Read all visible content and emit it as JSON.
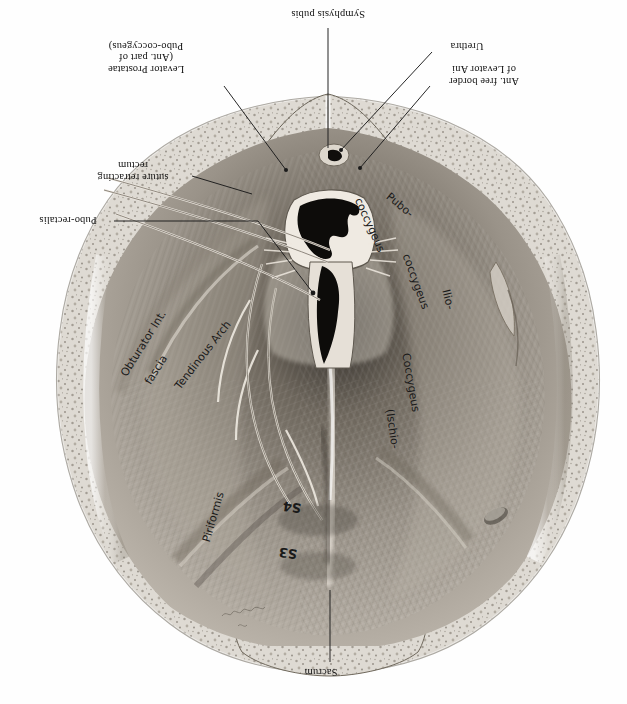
{
  "plate": {
    "title": "Male pelvic floor viewed from above (inverted plate)",
    "orientation": "upside-down",
    "background_color": "#fefefe",
    "ink_color": "#111111"
  },
  "printed_labels": [
    {
      "id": "symphysis-pubis",
      "text": "Symphysis pubis",
      "x": 258,
      "y": 8,
      "w": 140,
      "leader": [
        [
          328,
          28
        ],
        [
          328,
          128
        ]
      ]
    },
    {
      "id": "levator-prostatae",
      "text": "Levator Prostatae\n(Ant. part of\nPubo-coccygeus)",
      "x": 72,
      "y": 40,
      "w": 148,
      "leader": [
        [
          224,
          84
        ],
        [
          284,
          168
        ]
      ]
    },
    {
      "id": "urethra",
      "text": "Urethra",
      "x": 432,
      "y": 40,
      "w": 70,
      "leader": [
        [
          432,
          50
        ],
        [
          338,
          152
        ]
      ]
    },
    {
      "id": "ant-free-border-levator-ani",
      "text": "Ant. free border\nof Levator Ani",
      "x": 432,
      "y": 64,
      "w": 104,
      "leader": [
        [
          430,
          84
        ],
        [
          360,
          166
        ]
      ]
    },
    {
      "id": "suture-retracting-rectum",
      "text": "suture retracting\nrectum",
      "x": 78,
      "y": 160,
      "w": 110,
      "leader": [
        [
          190,
          176
        ],
        [
          255,
          196
        ]
      ]
    },
    {
      "id": "pubo-rectalis",
      "text": "Pubo-rectalis",
      "x": 24,
      "y": 216,
      "w": 88,
      "leader": [
        [
          114,
          221
        ],
        [
          258,
          221
        ],
        [
          312,
          292
        ]
      ]
    },
    {
      "id": "sacrum",
      "text": "Sacrum",
      "x": 288,
      "y": 666,
      "w": 66,
      "leader": [
        [
          330,
          664
        ],
        [
          330,
          590
        ]
      ]
    }
  ],
  "handwritten_labels": [
    {
      "id": "obturator-int-fascia",
      "text": "Obturator Int.",
      "x": 118,
      "y": 372,
      "rotate": -58
    },
    {
      "id": "obturator-fascia-word",
      "text": "fascia",
      "x": 136,
      "y": 374,
      "rotate": -58
    },
    {
      "id": "tendinous-arch",
      "text": "Tendinous Arch",
      "x": 168,
      "y": 378,
      "rotate": -52
    },
    {
      "id": "piriformis",
      "text": "Piriformis",
      "x": 196,
      "y": 530,
      "rotate": -76
    },
    {
      "id": "pubo-coccygeus-hand",
      "text": "Pubo-",
      "x": 392,
      "y": 196,
      "rotate": 38
    },
    {
      "id": "coccygeus-hand",
      "text": "coccygeus",
      "x": 368,
      "y": 208,
      "rotate": 62
    },
    {
      "id": "ilio-hand",
      "text": "Ilio-",
      "x": 446,
      "y": 300,
      "rotate": 74
    },
    {
      "id": "coccygeus2-hand",
      "text": "coccygeus",
      "x": 410,
      "y": 262,
      "rotate": 66
    },
    {
      "id": "coccygeus3-hand",
      "text": "Coccygeus",
      "x": 404,
      "y": 366,
      "rotate": 78
    },
    {
      "id": "ischio-coccygeus",
      "text": "(Ischio-",
      "x": 398,
      "y": 414,
      "rotate": 80
    },
    {
      "id": "s4-label",
      "text": "S4",
      "x": 300,
      "y": 516,
      "rotate": 186
    },
    {
      "id": "s3-label",
      "text": "S3",
      "x": 296,
      "y": 562,
      "rotate": 186
    }
  ]
}
